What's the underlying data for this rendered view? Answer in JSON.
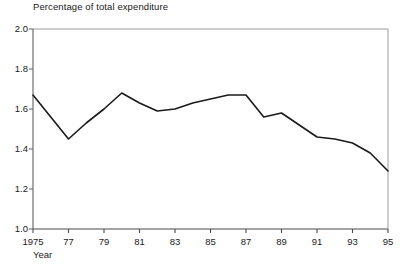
{
  "chart_data": {
    "type": "line",
    "title": "Percentage of total expenditure",
    "xlabel": "Year",
    "ylabel": "",
    "x": [
      1975,
      1976,
      1977,
      1978,
      1979,
      1980,
      1981,
      1982,
      1983,
      1984,
      1985,
      1986,
      1987,
      1988,
      1989,
      1990,
      1991,
      1992,
      1993,
      1994,
      1995
    ],
    "values": [
      1.67,
      1.56,
      1.45,
      1.53,
      1.6,
      1.68,
      1.63,
      1.59,
      1.6,
      1.63,
      1.65,
      1.67,
      1.67,
      1.56,
      1.58,
      1.52,
      1.46,
      1.45,
      1.43,
      1.38,
      1.29
    ],
    "xlim": [
      1975,
      1995
    ],
    "ylim": [
      1.0,
      2.0
    ],
    "ytick_values": [
      1.0,
      1.2,
      1.4,
      1.6,
      1.8,
      2.0
    ],
    "ytick_labels": [
      "1.0",
      "1.2",
      "1.4",
      "1.6",
      "1.8",
      "2.0"
    ],
    "xtick_values": [
      1975,
      1977,
      1979,
      1981,
      1983,
      1985,
      1987,
      1989,
      1991,
      1993,
      1995
    ],
    "xtick_labels": [
      "1975",
      "77",
      "79",
      "81",
      "83",
      "85",
      "87",
      "89",
      "91",
      "93",
      "95"
    ],
    "grid": false,
    "legend": null,
    "line_color": "#1a1a1a",
    "frame_color": "#8a8a8a",
    "axis_color": "#7a7a7a",
    "background_color": "#ffffff"
  }
}
